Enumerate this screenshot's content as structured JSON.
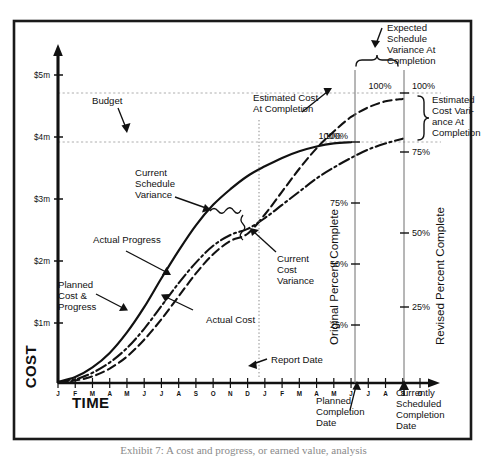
{
  "figure": {
    "border_color": "#1a1a1a",
    "background": "#ffffff",
    "ink_color": "#111111",
    "grid_color": "#9a9a9a",
    "caption": "Exhibit 7: A cost and progress, or earned value, analysis"
  },
  "chart_data": {
    "type": "line",
    "title": "",
    "subtitle": "",
    "xlabel": "TIME",
    "ylabel": "COST",
    "grid": true,
    "legend_position": "none",
    "x": [
      "J",
      "F",
      "M",
      "A",
      "M",
      "J",
      "J",
      "A",
      "S",
      "O",
      "N",
      "D",
      "J",
      "F",
      "M",
      "A",
      "M",
      "J",
      "J",
      "A",
      "S",
      "O"
    ],
    "x_tick_labels": [
      "J",
      "F",
      "M",
      "A",
      "M",
      "J",
      "J",
      "A",
      "S",
      "O",
      "N",
      "D",
      "J",
      "F",
      "M",
      "A",
      "M",
      "J",
      "J",
      "A",
      "S",
      "O"
    ],
    "xlim": [
      0,
      21
    ],
    "ylim": [
      0,
      5.4
    ],
    "y_tick_labels": [
      "$1m",
      "$2m",
      "$3m",
      "$4m",
      "$5m"
    ],
    "y_tick_values": [
      1,
      2,
      3,
      4,
      5
    ],
    "gridlines_y": [
      4.0,
      4.7
    ],
    "series": [
      {
        "name": "Planned Cost & Progress",
        "style": "solid",
        "points": [
          [
            0,
            0.02
          ],
          [
            1,
            0.1
          ],
          [
            2,
            0.26
          ],
          [
            3,
            0.5
          ],
          [
            4,
            0.84
          ],
          [
            5,
            1.26
          ],
          [
            6,
            1.74
          ],
          [
            7,
            2.2
          ],
          [
            8,
            2.62
          ],
          [
            9,
            2.96
          ],
          [
            10,
            3.22
          ],
          [
            11,
            3.44
          ],
          [
            12,
            3.6
          ],
          [
            13,
            3.74
          ],
          [
            14,
            3.85
          ],
          [
            15,
            3.93
          ],
          [
            16,
            3.98
          ],
          [
            17,
            4.0
          ]
        ],
        "end_value_label": "100%"
      },
      {
        "name": "Actual Progress",
        "style": "dash-dot",
        "points": [
          [
            0,
            0.01
          ],
          [
            1,
            0.06
          ],
          [
            2,
            0.17
          ],
          [
            3,
            0.34
          ],
          [
            4,
            0.58
          ],
          [
            5,
            0.9
          ],
          [
            6,
            1.28
          ],
          [
            7,
            1.66
          ],
          [
            8,
            2.0
          ],
          [
            9,
            2.28
          ],
          [
            10,
            2.46
          ],
          [
            11,
            2.56
          ],
          [
            12,
            2.74
          ],
          [
            13,
            2.96
          ],
          [
            14,
            3.18
          ],
          [
            15,
            3.4
          ],
          [
            16,
            3.58
          ],
          [
            17,
            3.74
          ],
          [
            18,
            3.88
          ],
          [
            19,
            3.98
          ],
          [
            20,
            4.06
          ]
        ]
      },
      {
        "name": "Actual Cost",
        "style": "dashed",
        "points": [
          [
            0,
            0.01
          ],
          [
            1,
            0.04
          ],
          [
            2,
            0.11
          ],
          [
            3,
            0.24
          ],
          [
            4,
            0.44
          ],
          [
            5,
            0.72
          ],
          [
            6,
            1.06
          ],
          [
            7,
            1.44
          ],
          [
            8,
            1.82
          ],
          [
            9,
            2.14
          ],
          [
            10,
            2.36
          ],
          [
            11,
            2.48
          ],
          [
            12,
            2.8
          ],
          [
            13,
            3.18
          ],
          [
            14,
            3.56
          ],
          [
            15,
            3.9
          ],
          [
            16,
            4.18
          ],
          [
            17,
            4.42
          ],
          [
            18,
            4.58
          ],
          [
            19,
            4.68
          ],
          [
            20,
            4.72
          ]
        ],
        "end_value_label": "100%"
      }
    ],
    "percent_axes": [
      {
        "name": "Original Percent Complete",
        "ticks": [
          "25%",
          "50%",
          "75%",
          "100%"
        ],
        "tick_values": [
          25,
          50,
          75,
          100
        ],
        "at_x": 17
      },
      {
        "name": "Revised Percent Complete",
        "ticks": [
          "25%",
          "50%",
          "75%",
          "100%"
        ],
        "tick_values": [
          25,
          50,
          75,
          100
        ],
        "at_x": 20
      }
    ],
    "annotations": [
      {
        "id": "budget",
        "label": "Budget"
      },
      {
        "id": "current-schedule-variance",
        "label": "Current\nSchedule\nVariance"
      },
      {
        "id": "actual-progress",
        "label": "Actual Progress"
      },
      {
        "id": "planned-cost-progress",
        "label": "Planned\nCost &\nProgress"
      },
      {
        "id": "actual-cost",
        "label": "Actual Cost"
      },
      {
        "id": "current-cost-variance",
        "label": "Current\nCost\nVariance"
      },
      {
        "id": "report-date",
        "label": "Report Date"
      },
      {
        "id": "estimated-cost-at-completion",
        "label": "Estimated Cost\nAt Completion"
      },
      {
        "id": "expected-schedule-variance",
        "label": "Expected\nSchedule\nVariance At\nCompletion"
      },
      {
        "id": "estimated-cost-variance",
        "label": "Estimated\nCost Vari-\nance At\nCompletion"
      },
      {
        "id": "planned-completion-date",
        "label": "Planned\nCompletion\nDate"
      },
      {
        "id": "currently-scheduled-completion-date",
        "label": "Currently\nScheduled\nCompletion\nDate"
      }
    ]
  },
  "labels": {
    "axis_cost": "COST",
    "axis_time": "TIME",
    "y_ticks": [
      "$5m",
      "$4m",
      "$3m",
      "$2m",
      "$1m"
    ],
    "budget": "Budget",
    "current_schedule_variance_l1": "Current",
    "current_schedule_variance_l2": "Schedule",
    "current_schedule_variance_l3": "Variance",
    "actual_progress": "Actual Progress",
    "planned_cost_l1": "Planned",
    "planned_cost_l2": "Cost &",
    "planned_cost_l3": "Progress",
    "actual_cost": "Actual Cost",
    "current_cost_variance_l1": "Current",
    "current_cost_variance_l2": "Cost",
    "current_cost_variance_l3": "Variance",
    "report_date": "Report Date",
    "estimated_cost_at_completion_l1": "Estimated Cost",
    "estimated_cost_at_completion_l2": "At Completion",
    "expected_sched_var_l1": "Expected",
    "expected_sched_var_l2": "Schedule",
    "expected_sched_var_l3": "Variance At",
    "expected_sched_var_l4": "Completion",
    "est_cost_var_l1": "Estimated",
    "est_cost_var_l2": "Cost Vari-",
    "est_cost_var_l3": "ance At",
    "est_cost_var_l4": "Completion",
    "planned_completion_l1": "Planned",
    "planned_completion_l2": "Completion",
    "planned_completion_l3": "Date",
    "currently_sched_l1": "Currently",
    "currently_sched_l2": "Scheduled",
    "currently_sched_l3": "Completion",
    "currently_sched_l4": "Date",
    "pct_100_solid": "100%",
    "pct_100_dashed": "100%",
    "orig_pct_axis_title": "Original Percent Complete",
    "orig_pct_25": "25%",
    "orig_pct_50": "50%",
    "orig_pct_75": "75%",
    "orig_pct_100": "100%",
    "rev_pct_axis_title": "Revised Percent Complete",
    "rev_pct_25": "25%",
    "rev_pct_50": "50%",
    "rev_pct_75": "75%",
    "rev_pct_100": "100%"
  }
}
